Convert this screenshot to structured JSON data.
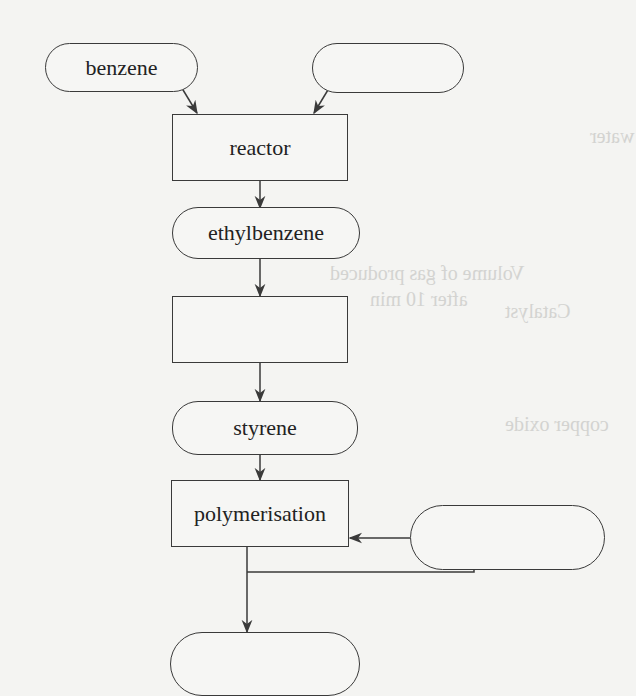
{
  "diagram": {
    "title": "",
    "nodes": {
      "benzene": {
        "label": "benzene",
        "shape": "terminal"
      },
      "input_blank": {
        "label": "",
        "shape": "terminal"
      },
      "reactor": {
        "label": "reactor",
        "shape": "process"
      },
      "ethylbenzene": {
        "label": "ethylbenzene",
        "shape": "terminal"
      },
      "process_blank": {
        "label": "",
        "shape": "process"
      },
      "styrene": {
        "label": "styrene",
        "shape": "terminal"
      },
      "polymerisation": {
        "label": "polymerisation",
        "shape": "process"
      },
      "recycle_blank": {
        "label": "",
        "shape": "terminal"
      },
      "product_blank": {
        "label": "",
        "shape": "terminal"
      }
    },
    "edges": [
      {
        "from": "benzene",
        "to": "reactor"
      },
      {
        "from": "input_blank",
        "to": "reactor"
      },
      {
        "from": "reactor",
        "to": "ethylbenzene"
      },
      {
        "from": "ethylbenzene",
        "to": "process_blank"
      },
      {
        "from": "process_blank",
        "to": "styrene"
      },
      {
        "from": "styrene",
        "to": "polymerisation"
      },
      {
        "from": "polymerisation",
        "to": "product_blank"
      },
      {
        "from": "polymerisation",
        "to": "recycle_blank"
      },
      {
        "from": "recycle_blank",
        "to": "polymerisation"
      }
    ],
    "colors": {
      "line": "#3a3a3a",
      "background": "#f4f4f2"
    }
  },
  "show_through": {
    "line1": "Volume of gas produced",
    "line2": "after 10 min",
    "line3": "Catalyst",
    "line4": "copper oxide",
    "line5": "water"
  }
}
